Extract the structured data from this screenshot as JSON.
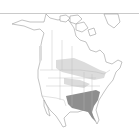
{
  "map": {
    "region": "North America",
    "type": "species range map",
    "colors": {
      "background": "#ffffff",
      "coastline": "#9a9a9a",
      "borders": "#b5b5b5",
      "range_light": "#dcdcdc",
      "range_dark": "#8e8e8e"
    },
    "layers": [
      {
        "name": "light-range",
        "description": "light gray shaded range across northern Great Plains, Great Lakes, northeastern US and Pacific coast"
      },
      {
        "name": "dark-range",
        "description": "dark gray shaded range across southeastern United States"
      }
    ]
  }
}
